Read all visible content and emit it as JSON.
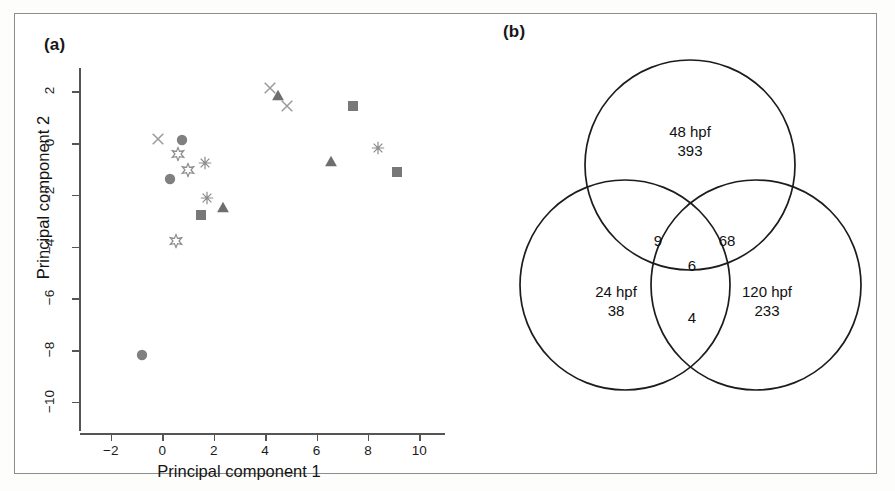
{
  "figure": {
    "panel_a_label": "(a)",
    "panel_b_label": "(b)"
  },
  "chart_data": [
    {
      "type": "scatter",
      "panel": "(a)",
      "title": "",
      "xlabel": "Principal component 1",
      "ylabel": "Principal component 2",
      "xlim": [
        -3.2,
        11.0
      ],
      "ylim": [
        -11.2,
        2.9
      ],
      "xticks": [
        -2,
        0,
        2,
        4,
        6,
        8,
        10
      ],
      "xticklabels": [
        "−2",
        "0",
        "2",
        "4",
        "6",
        "8",
        "10"
      ],
      "yticks": [
        2,
        0,
        -2,
        -4,
        -6,
        -8,
        -10
      ],
      "yticklabels": [
        "2",
        "0",
        "−2",
        "−4",
        "−6",
        "−8",
        "−10"
      ],
      "grid": false,
      "legend": "none",
      "series": [
        {
          "name": "cross",
          "marker": "x",
          "color": "#9a9a9a",
          "points": [
            [
              -0.15,
              0.1
            ],
            [
              4.2,
              2.05
            ],
            [
              4.85,
              1.35
            ]
          ]
        },
        {
          "name": "circle",
          "marker": "filled-circle",
          "color": "#808080",
          "points": [
            [
              0.75,
              0.05
            ],
            [
              0.3,
              -1.45
            ],
            [
              -0.8,
              -8.25
            ]
          ]
        },
        {
          "name": "star",
          "marker": "open-star",
          "color": "#8f8f8f",
          "points": [
            [
              0.62,
              -0.5
            ],
            [
              1.0,
              -1.12
            ],
            [
              0.55,
              -3.85
            ]
          ]
        },
        {
          "name": "asterisk",
          "marker": "asterisk",
          "color": "#8a8a8a",
          "points": [
            [
              1.65,
              -0.85
            ],
            [
              1.75,
              -2.2
            ],
            [
              8.4,
              -0.25
            ]
          ]
        },
        {
          "name": "square",
          "marker": "filled-square",
          "color": "#787878",
          "points": [
            [
              1.5,
              -2.85
            ],
            [
              7.4,
              1.35
            ],
            [
              9.15,
              -1.2
            ]
          ]
        },
        {
          "name": "triangle",
          "marker": "filled-triangle",
          "color": "#6e6e6e",
          "points": [
            [
              4.5,
              1.8
            ],
            [
              2.35,
              -2.55
            ],
            [
              6.55,
              -0.75
            ]
          ]
        }
      ]
    },
    {
      "type": "venn",
      "panel": "(b)",
      "title": "",
      "sets": [
        {
          "name": "48 hpf",
          "label": "48 hpf",
          "only": 393
        },
        {
          "name": "24 hpf",
          "label": "24 hpf",
          "only": 38
        },
        {
          "name": "120 hpf",
          "label": "120 hpf",
          "only": 233
        }
      ],
      "intersections": [
        {
          "sets": [
            "24 hpf",
            "48 hpf"
          ],
          "value": 9
        },
        {
          "sets": [
            "48 hpf",
            "120 hpf"
          ],
          "value": 68
        },
        {
          "sets": [
            "24 hpf",
            "120 hpf"
          ],
          "value": 4
        },
        {
          "sets": [
            "24 hpf",
            "48 hpf",
            "120 hpf"
          ],
          "value": 6
        }
      ]
    }
  ],
  "venn": {
    "top_label": "48 hpf",
    "top_value": "393",
    "left_label": "24 hpf",
    "left_value": "38",
    "right_label": "120 hpf",
    "right_value": "233",
    "top_left_value": "9",
    "top_right_value": "68",
    "bottom_value": "4",
    "center_value": "6"
  },
  "colors": {
    "frame": "#8d8d8d",
    "axis": "#555555",
    "text": "#1a1a1a",
    "venn_stroke": "#1c1c1c"
  }
}
